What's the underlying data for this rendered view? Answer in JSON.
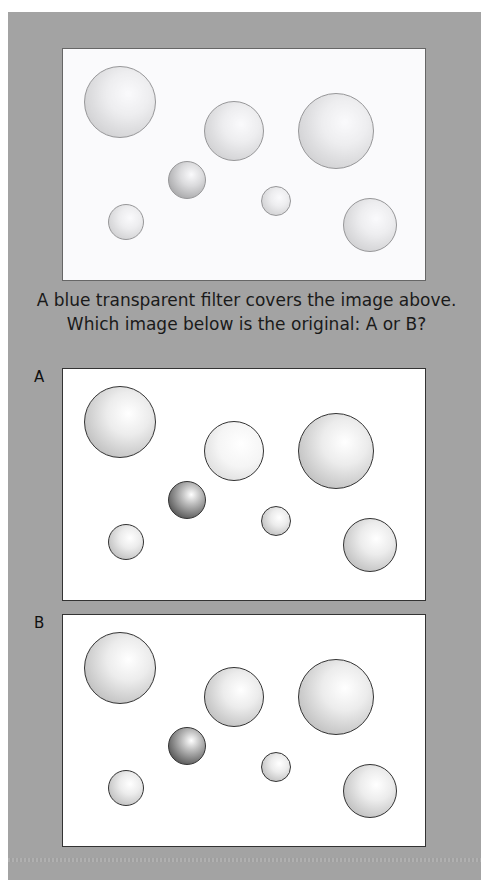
{
  "question": {
    "line1": "A blue transparent filter covers the image above.",
    "line2": "Which image below is the original: A or B?"
  },
  "options": [
    {
      "label": "A"
    },
    {
      "label": "B"
    }
  ],
  "colors": {
    "background_card": "#a3a3a3",
    "panel": "#ffffff",
    "outline": "#333333"
  },
  "spheres": [
    {
      "id": 1,
      "cx": 57,
      "cy": 53,
      "r": 36,
      "shade": "light"
    },
    {
      "id": 2,
      "cx": 171,
      "cy": 82,
      "r": 30,
      "shade": "light"
    },
    {
      "id": 3,
      "cx": 273,
      "cy": 82,
      "r": 38,
      "shade": "light"
    },
    {
      "id": 4,
      "cx": 124,
      "cy": 131,
      "r": 19,
      "shade": "dark"
    },
    {
      "id": 5,
      "cx": 213,
      "cy": 152,
      "r": 15,
      "shade": "light"
    },
    {
      "id": 6,
      "cx": 63,
      "cy": 173,
      "r": 18,
      "shade": "light"
    },
    {
      "id": 7,
      "cx": 307,
      "cy": 176,
      "r": 27,
      "shade": "light"
    }
  ]
}
